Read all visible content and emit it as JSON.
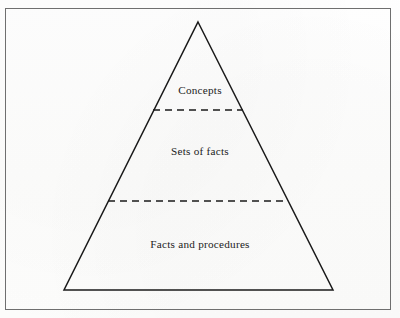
{
  "figure": {
    "type": "knowledge-pyramid-diagram",
    "background_color": "#fefefe",
    "frame": {
      "border_color": "#6f6f6f",
      "border_width_px": 1
    },
    "pyramid": {
      "outline_color": "#1a1a1a",
      "outline_width_px": 1.5,
      "fill": "none",
      "apex": {
        "x": 198,
        "y": 22
      },
      "base_left": {
        "x": 64,
        "y": 290
      },
      "base_right": {
        "x": 333,
        "y": 290
      },
      "divider_color": "#1a1a1a",
      "divider_style": "dashed",
      "divider_width_px": 1.6,
      "dash_pattern": "7,5"
    },
    "dividers": [
      {
        "name": "upper-divider",
        "y": 110,
        "x1": 153,
        "x2": 243
      },
      {
        "name": "lower-divider",
        "y": 201,
        "x1": 108,
        "x2": 288
      }
    ],
    "tiers": [
      {
        "id": "top",
        "label": "Concepts"
      },
      {
        "id": "middle",
        "label": "Sets of facts"
      },
      {
        "id": "bottom",
        "label": "Facts and procedures"
      }
    ]
  }
}
